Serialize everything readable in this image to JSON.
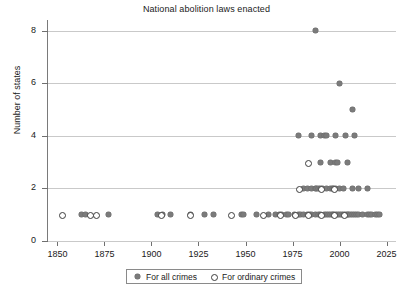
{
  "chart_data": {
    "type": "scatter",
    "title": "National abolition laws enacted",
    "xlabel": "",
    "ylabel": "Number of states",
    "xlim": [
      1845,
      2030
    ],
    "ylim": [
      0,
      8.4
    ],
    "xticks": [
      1850,
      1875,
      1900,
      1925,
      1950,
      1975,
      2000,
      2025
    ],
    "yticks": [
      0,
      2,
      4,
      6,
      8
    ],
    "grid": "horizontal",
    "legend_position": "below-axis-center",
    "series": [
      {
        "name": "For all crimes",
        "marker": "filled-diamond",
        "color": "#7b7b7b",
        "points": [
          [
            1863,
            1
          ],
          [
            1865,
            1
          ],
          [
            1877,
            1
          ],
          [
            1903,
            1
          ],
          [
            1906,
            1
          ],
          [
            1910,
            1
          ],
          [
            1921,
            1
          ],
          [
            1928,
            1
          ],
          [
            1933,
            1
          ],
          [
            1948,
            1
          ],
          [
            1949,
            1
          ],
          [
            1956,
            1
          ],
          [
            1962,
            1
          ],
          [
            1966,
            1
          ],
          [
            1968,
            1
          ],
          [
            1969,
            1
          ],
          [
            1972,
            1
          ],
          [
            1973,
            1
          ],
          [
            1976,
            1
          ],
          [
            1978,
            1
          ],
          [
            1979,
            1
          ],
          [
            1981,
            1
          ],
          [
            1983,
            1
          ],
          [
            1984,
            1
          ],
          [
            1985,
            1
          ],
          [
            1987,
            1
          ],
          [
            1989,
            1
          ],
          [
            1990,
            1
          ],
          [
            1992,
            1
          ],
          [
            1993,
            1
          ],
          [
            1994,
            1
          ],
          [
            1995,
            1
          ],
          [
            1996,
            1
          ],
          [
            1997,
            1
          ],
          [
            1998,
            1
          ],
          [
            1999,
            1
          ],
          [
            2000,
            1
          ],
          [
            2001,
            1
          ],
          [
            2002,
            1
          ],
          [
            2003,
            1
          ],
          [
            2004,
            1
          ],
          [
            2005,
            1
          ],
          [
            2006,
            1
          ],
          [
            2007,
            1
          ],
          [
            2008,
            1
          ],
          [
            2009,
            1
          ],
          [
            2010,
            1
          ],
          [
            2012,
            1
          ],
          [
            2015,
            1
          ],
          [
            2016,
            1
          ],
          [
            2017,
            1
          ],
          [
            2019,
            1
          ],
          [
            2020,
            1
          ],
          [
            2021,
            1
          ],
          [
            1981,
            2
          ],
          [
            1983,
            2
          ],
          [
            1985,
            2
          ],
          [
            1987,
            2
          ],
          [
            1988,
            2
          ],
          [
            1989,
            2
          ],
          [
            1990,
            2
          ],
          [
            1991,
            2
          ],
          [
            1993,
            2
          ],
          [
            1995,
            2
          ],
          [
            1996,
            2
          ],
          [
            1997,
            2
          ],
          [
            1998,
            2
          ],
          [
            2000,
            2
          ],
          [
            2002,
            2
          ],
          [
            2007,
            2
          ],
          [
            2010,
            2
          ],
          [
            2015,
            2
          ],
          [
            1990,
            3
          ],
          [
            1995,
            3
          ],
          [
            1998,
            3
          ],
          [
            1999,
            3
          ],
          [
            2004,
            3
          ],
          [
            1978,
            4
          ],
          [
            1985,
            4
          ],
          [
            1990,
            4
          ],
          [
            1992,
            4
          ],
          [
            1993,
            4
          ],
          [
            1998,
            4
          ],
          [
            2003,
            4
          ],
          [
            2008,
            4
          ],
          [
            2007,
            5
          ],
          [
            2000,
            6
          ],
          [
            1987,
            8
          ]
        ]
      },
      {
        "name": "For ordinary crimes",
        "marker": "open-circle",
        "color": "#3d3d3d",
        "points": [
          [
            1852,
            1
          ],
          [
            1867,
            1
          ],
          [
            1870,
            1
          ],
          [
            1905,
            1
          ],
          [
            1920,
            1
          ],
          [
            1942,
            1
          ],
          [
            1959,
            1
          ],
          [
            1968,
            1
          ],
          [
            1976,
            1
          ],
          [
            1983,
            1
          ],
          [
            1990,
            1
          ],
          [
            1997,
            1
          ],
          [
            2002,
            1
          ],
          [
            1978,
            2
          ],
          [
            1990,
            2
          ],
          [
            1997,
            2
          ],
          [
            1983,
            3
          ]
        ]
      }
    ]
  },
  "legend": {
    "entries": [
      {
        "label": "For all crimes",
        "marker": "filled-diamond-icon"
      },
      {
        "label": "For ordinary crimes",
        "marker": "open-circle-icon"
      }
    ]
  }
}
